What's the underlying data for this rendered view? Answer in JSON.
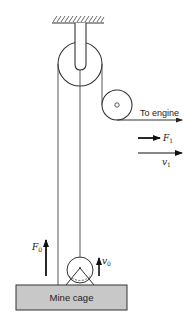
{
  "diagram": {
    "type": "pulley-hoist",
    "labels": {
      "engine": "To engine",
      "cage": "Mine cage",
      "force_engine": "F",
      "force_engine_sub": "1",
      "velocity_engine": "v",
      "velocity_engine_sub": "1",
      "force_cage": "F",
      "force_cage_sub": "0",
      "velocity_cage": "v",
      "velocity_cage_sub": "0"
    },
    "colors": {
      "line": "#333333",
      "cage_fill": "#c8c8c8",
      "arrow": "#111111"
    }
  }
}
